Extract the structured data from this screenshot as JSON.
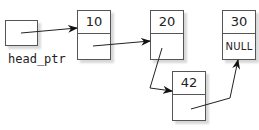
{
  "diagram": {
    "type": "linked-list",
    "head_label": "head_ptr",
    "nodes": [
      {
        "value": "10",
        "next": ""
      },
      {
        "value": "20",
        "next": ""
      },
      {
        "value": "30",
        "next": "NULL"
      },
      {
        "value": "42",
        "next": ""
      }
    ],
    "links": [
      {
        "from": "head_ptr",
        "to": "10"
      },
      {
        "from": "10",
        "to": "20"
      },
      {
        "from": "20",
        "to": "42"
      },
      {
        "from": "42",
        "to": "30"
      }
    ]
  }
}
